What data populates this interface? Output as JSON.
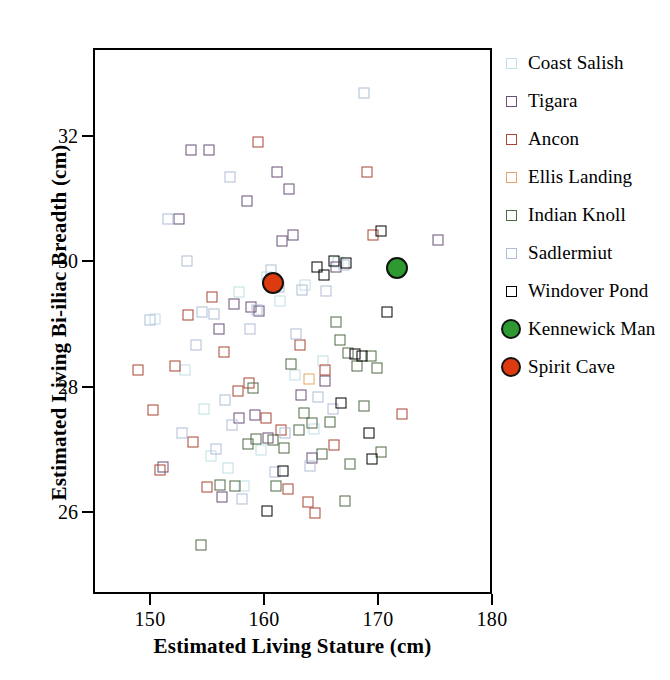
{
  "chart_data": {
    "type": "scatter",
    "title": "",
    "xlabel": "Estimated Living Stature (cm)",
    "ylabel": "Estimated Living Bi-iliac Breadth (cm)",
    "xlim": [
      145.0,
      180.0
    ],
    "ylim": [
      24.7,
      33.4
    ],
    "xticks": [
      150,
      160,
      170,
      180
    ],
    "yticks": [
      26,
      28,
      30,
      32
    ],
    "xticklabels": [
      "150",
      "160",
      "170",
      "180"
    ],
    "yticklabels": [
      "26",
      "28",
      "30",
      "32"
    ],
    "grid": false,
    "legend_position": "right",
    "marker_square_size_px": 11,
    "marker_circle_size_px": 22,
    "series": [
      {
        "name": "Coast Salish",
        "color": "#bfe0e4",
        "marker": "square-open",
        "points": [
          [
            150.3,
            29.12
          ],
          [
            152.9,
            28.3
          ],
          [
            154.6,
            27.68
          ],
          [
            155.2,
            26.93
          ],
          [
            156.7,
            26.74
          ],
          [
            157.6,
            29.55
          ],
          [
            158.1,
            26.46
          ],
          [
            159.6,
            27.02
          ],
          [
            160.1,
            29.79
          ],
          [
            161.2,
            29.4
          ],
          [
            162.5,
            28.22
          ],
          [
            163.4,
            29.66
          ],
          [
            164.2,
            27.36
          ],
          [
            165.0,
            28.45
          ],
          [
            166.3,
            30.02
          ]
        ]
      },
      {
        "name": "Tigara",
        "color": "#6b4f77",
        "marker": "square-open",
        "points": [
          [
            153.4,
            31.8
          ],
          [
            155.0,
            31.8
          ],
          [
            155.9,
            28.96
          ],
          [
            157.2,
            29.36
          ],
          [
            157.6,
            27.54
          ],
          [
            158.3,
            30.99
          ],
          [
            158.7,
            29.3
          ],
          [
            159.0,
            27.58
          ],
          [
            159.4,
            29.24
          ],
          [
            160.2,
            27.22
          ],
          [
            161.0,
            31.45
          ],
          [
            161.4,
            30.36
          ],
          [
            162.0,
            31.19
          ],
          [
            162.4,
            30.45
          ],
          [
            163.1,
            27.9
          ],
          [
            164.0,
            26.9
          ],
          [
            165.2,
            28.12
          ],
          [
            166.1,
            29.95
          ],
          [
            175.1,
            30.38
          ],
          [
            151.0,
            26.76
          ],
          [
            156.1,
            26.28
          ],
          [
            152.4,
            30.7
          ]
        ]
      },
      {
        "name": "Ancon",
        "color": "#aa4433",
        "marker": "square-open",
        "points": [
          [
            148.8,
            28.3
          ],
          [
            150.1,
            27.67
          ],
          [
            152.0,
            28.36
          ],
          [
            153.2,
            29.17
          ],
          [
            153.6,
            27.15
          ],
          [
            154.8,
            26.44
          ],
          [
            155.3,
            29.46
          ],
          [
            156.3,
            28.58
          ],
          [
            157.5,
            27.97
          ],
          [
            158.5,
            28.1
          ],
          [
            159.3,
            31.93
          ],
          [
            160.0,
            27.53
          ],
          [
            161.3,
            27.35
          ],
          [
            161.9,
            26.4
          ],
          [
            163.0,
            28.7
          ],
          [
            163.7,
            26.2
          ],
          [
            165.2,
            28.3
          ],
          [
            166.0,
            27.1
          ],
          [
            168.9,
            31.45
          ],
          [
            169.4,
            30.45
          ],
          [
            171.9,
            27.6
          ],
          [
            164.3,
            26.03
          ],
          [
            150.7,
            26.7
          ]
        ]
      },
      {
        "name": "Ellis Landing",
        "color": "#e8a365",
        "marker": "square-open",
        "points": [
          [
            163.8,
            28.15
          ]
        ]
      },
      {
        "name": "Indian Knoll",
        "color": "#4e6b45",
        "marker": "square-open",
        "points": [
          [
            154.3,
            25.51
          ],
          [
            156.0,
            26.47
          ],
          [
            157.3,
            26.45
          ],
          [
            158.4,
            27.12
          ],
          [
            159.1,
            27.2
          ],
          [
            160.6,
            27.18
          ],
          [
            161.6,
            27.06
          ],
          [
            162.2,
            28.4
          ],
          [
            162.9,
            27.35
          ],
          [
            163.3,
            27.62
          ],
          [
            164.0,
            27.45
          ],
          [
            164.9,
            26.96
          ],
          [
            165.6,
            27.48
          ],
          [
            166.1,
            29.06
          ],
          [
            166.5,
            28.78
          ],
          [
            167.2,
            28.57
          ],
          [
            167.4,
            26.8
          ],
          [
            168.0,
            28.36
          ],
          [
            168.6,
            27.72
          ],
          [
            169.2,
            28.52
          ],
          [
            169.7,
            28.34
          ],
          [
            170.1,
            27.0
          ],
          [
            166.9,
            26.22
          ],
          [
            160.9,
            26.45
          ],
          [
            158.9,
            28.02
          ]
        ]
      },
      {
        "name": "Sadlermiut",
        "color": "#aebdd6",
        "marker": "square-open",
        "points": [
          [
            149.8,
            29.1
          ],
          [
            151.4,
            30.71
          ],
          [
            153.1,
            30.03
          ],
          [
            153.9,
            28.7
          ],
          [
            154.4,
            29.22
          ],
          [
            155.4,
            29.2
          ],
          [
            156.4,
            27.82
          ],
          [
            157.0,
            27.43
          ],
          [
            157.9,
            26.24
          ],
          [
            158.6,
            28.95
          ],
          [
            159.2,
            29.25
          ],
          [
            160.4,
            29.9
          ],
          [
            160.8,
            26.67
          ],
          [
            161.1,
            29.62
          ],
          [
            161.7,
            27.3
          ],
          [
            162.6,
            28.87
          ],
          [
            163.2,
            29.58
          ],
          [
            163.9,
            26.77
          ],
          [
            164.6,
            27.87
          ],
          [
            165.3,
            29.56
          ],
          [
            165.9,
            27.68
          ],
          [
            166.8,
            29.98
          ],
          [
            168.6,
            32.72
          ],
          [
            156.8,
            31.37
          ],
          [
            155.6,
            27.05
          ],
          [
            152.6,
            27.3
          ]
        ]
      },
      {
        "name": "Windover Pond",
        "color": "#000000",
        "marker": "square-open",
        "points": [
          [
            160.1,
            26.05
          ],
          [
            161.5,
            26.69
          ],
          [
            164.5,
            29.94
          ],
          [
            165.1,
            29.82
          ],
          [
            166.0,
            30.04
          ],
          [
            166.6,
            27.78
          ],
          [
            167.8,
            28.56
          ],
          [
            168.4,
            28.53
          ],
          [
            169.0,
            27.3
          ],
          [
            169.3,
            26.88
          ],
          [
            170.1,
            30.51
          ],
          [
            170.6,
            29.23
          ],
          [
            167.0,
            30.0
          ]
        ]
      },
      {
        "name": "Kennewick Man",
        "color": "#2e9930",
        "marker": "circle-filled",
        "points": [
          [
            171.5,
            29.93
          ]
        ]
      },
      {
        "name": "Spirit Cave",
        "color": "#de3a10",
        "marker": "circle-filled",
        "points": [
          [
            160.6,
            29.68
          ]
        ]
      }
    ]
  },
  "legend": {
    "items": [
      {
        "label": "Coast Salish",
        "color": "#bfe0e4",
        "marker": "square-open"
      },
      {
        "label": "Tigara",
        "color": "#6b4f77",
        "marker": "square-open"
      },
      {
        "label": "Ancon",
        "color": "#aa4433",
        "marker": "square-open"
      },
      {
        "label": "Ellis Landing",
        "color": "#e8a365",
        "marker": "square-open"
      },
      {
        "label": "Indian Knoll",
        "color": "#4e6b45",
        "marker": "square-open"
      },
      {
        "label": "Sadlermiut",
        "color": "#aebdd6",
        "marker": "square-open"
      },
      {
        "label": "Windover Pond",
        "color": "#000000",
        "marker": "square-open"
      },
      {
        "label": "Kennewick Man",
        "color": "#2e9930",
        "marker": "circle-filled"
      },
      {
        "label": "Spirit Cave",
        "color": "#de3a10",
        "marker": "circle-filled"
      }
    ]
  }
}
